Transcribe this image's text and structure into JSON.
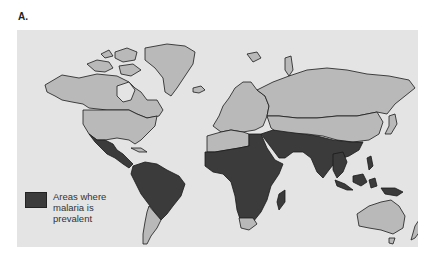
{
  "figure": {
    "label": "A."
  },
  "map": {
    "type": "world-choropleth",
    "colors": {
      "background": "#e4e4e4",
      "land": "#b9b9b9",
      "malaria": "#3b3b3b",
      "border": "#1a1a1a"
    },
    "highlighted_regions": [
      "Mexico",
      "Central America",
      "Northern South America",
      "Brazil",
      "Sub-Saharan Africa",
      "Madagascar",
      "Egypt",
      "Middle East",
      "Arabian Peninsula",
      "South Asia",
      "Southeast Asia",
      "Southern China",
      "Indonesia",
      "New Guinea"
    ]
  },
  "legend": {
    "swatch_color": "#3b3b3b",
    "label": "Areas where malaria is prevalent"
  }
}
